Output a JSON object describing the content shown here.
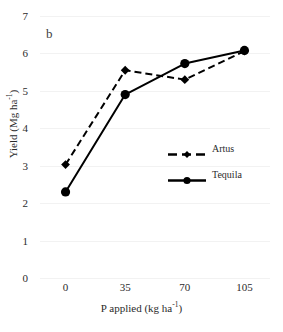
{
  "figure": {
    "panel_label": "b",
    "background_color": "#ffffff",
    "line_color": "#000000"
  },
  "chart_data": {
    "type": "line",
    "title": "",
    "panel": "b",
    "xlabel": "P applied (kg ha-1)",
    "xlabel_parts": {
      "base": "P applied (kg ha",
      "sup": "-1",
      "tail": ")"
    },
    "ylabel": "Yield (Mg ha-1)",
    "ylabel_parts": {
      "base": "Yield (Mg ha",
      "sup": "-1",
      "tail": ")"
    },
    "x": [
      0,
      35,
      70,
      105
    ],
    "categories": [
      "0",
      "35",
      "70",
      "105"
    ],
    "xtick_labels": [
      "0",
      "35",
      "70",
      "105"
    ],
    "ytick_labels": [
      "0",
      "1",
      "2",
      "3",
      "4",
      "5",
      "6",
      "7"
    ],
    "yticks": [
      0,
      1,
      2,
      3,
      4,
      5,
      6,
      7
    ],
    "ylim": [
      0,
      7
    ],
    "xlim": [
      -15,
      120
    ],
    "grid": "horizontal-light",
    "legend_position": "center-right-inside",
    "series": [
      {
        "name": "Artus",
        "values": [
          3.03,
          5.55,
          5.3,
          6.06
        ],
        "line_style": "dashed",
        "marker": "diamond",
        "color": "#000000"
      },
      {
        "name": "Tequila",
        "values": [
          2.3,
          4.9,
          5.73,
          6.08
        ],
        "line_style": "solid",
        "marker": "circle",
        "color": "#000000"
      }
    ]
  },
  "legend": {
    "items": [
      {
        "label": "Artus"
      },
      {
        "label": "Tequila"
      }
    ]
  }
}
